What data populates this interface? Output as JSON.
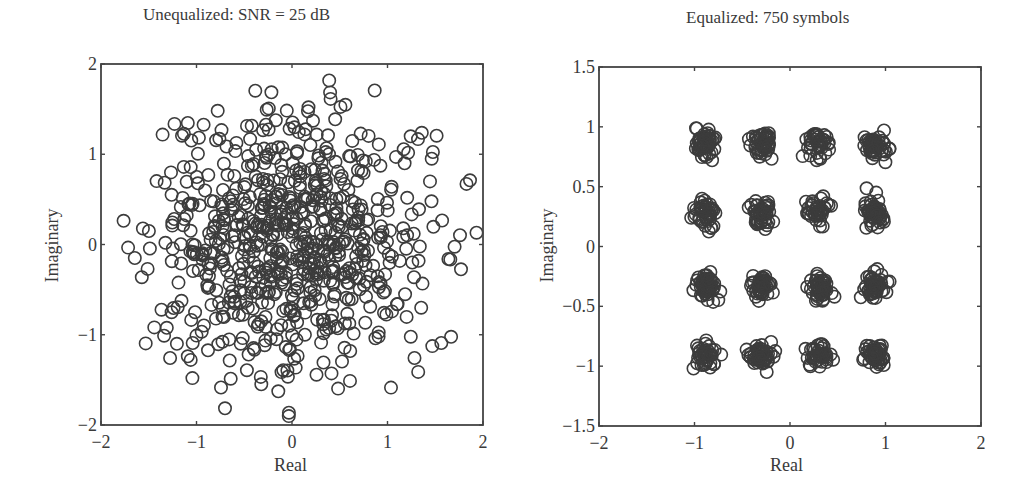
{
  "figure": {
    "background": "#ffffff",
    "axis_color": "#444444",
    "marker_color": "#3c3c3c"
  },
  "chart_data": [
    {
      "type": "scatter",
      "title": "Unequalized: SNR = 25 dB",
      "xlabel": "Real",
      "ylabel": "Imaginary",
      "xlim": [
        -2,
        2
      ],
      "ylim": [
        -2,
        2
      ],
      "xticks": [
        -2,
        -1,
        0,
        1,
        2
      ],
      "xtick_labels": [
        "−2",
        "−1",
        "0",
        "1",
        "2"
      ],
      "yticks": [
        -2,
        -1,
        0,
        1,
        2
      ],
      "ytick_labels": [
        "−2",
        "−1",
        "0",
        "1",
        "2"
      ],
      "grid": false,
      "legend": null,
      "marker": "open-circle",
      "description": "Unequalized received symbols forming a diffuse circular cloud centered at origin, radius up to ~2",
      "point_count_approx": 750,
      "distribution": {
        "kind": "gaussian-cloud",
        "center": [
          0,
          0
        ],
        "sigma": 0.72,
        "clip_radius": 2.0,
        "seed": 7
      }
    },
    {
      "type": "scatter",
      "title": "Equalized: 750 symbols",
      "xlabel": "Real",
      "ylabel": "Imaginary",
      "xlim": [
        -2,
        2
      ],
      "ylim": [
        -1.5,
        1.5
      ],
      "xticks": [
        -2,
        -1,
        0,
        1,
        2
      ],
      "xtick_labels": [
        "−2",
        "−1",
        "0",
        "1",
        "2"
      ],
      "yticks": [
        -1.5,
        -1,
        -0.5,
        0,
        0.5,
        1,
        1.5
      ],
      "ytick_labels": [
        "−1.5",
        "−1",
        "−0.5",
        "0",
        "0.5",
        "1",
        "1.5"
      ],
      "grid": false,
      "legend": null,
      "marker": "open-circle",
      "description": "16-QAM constellation after equalization: 16 tight clusters",
      "point_count": 750,
      "cluster_centers_x": [
        -0.89,
        -0.3,
        0.3,
        0.89
      ],
      "cluster_centers_y": [
        0.86,
        0.28,
        -0.33,
        -0.91
      ],
      "distribution": {
        "kind": "qam-clusters",
        "sigma": 0.055,
        "seed": 11
      }
    }
  ]
}
